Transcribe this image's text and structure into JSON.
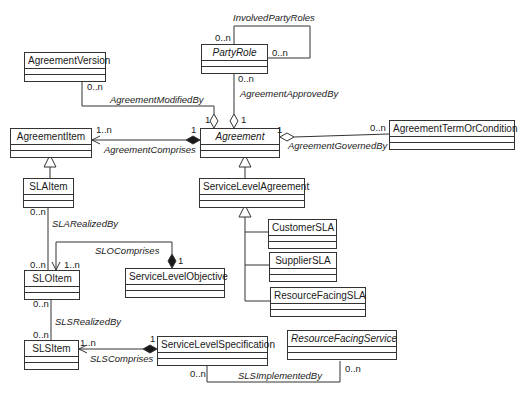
{
  "diagram": {
    "type": "UML class diagram",
    "classes": [
      {
        "id": "agreement_version",
        "name": "AgreementVersion",
        "abstract": false
      },
      {
        "id": "party_role",
        "name": "PartyRole",
        "abstract": true
      },
      {
        "id": "agreement_item",
        "name": "AgreementItem",
        "abstract": false
      },
      {
        "id": "agreement",
        "name": "Agreement",
        "abstract": true
      },
      {
        "id": "agreement_term",
        "name": "AgreementTermOrCondition",
        "abstract": false
      },
      {
        "id": "sla_item",
        "name": "SLAItem",
        "abstract": false
      },
      {
        "id": "service_level_agreement",
        "name": "ServiceLevelAgreement",
        "abstract": false
      },
      {
        "id": "customer_sla",
        "name": "CustomerSLA",
        "abstract": false
      },
      {
        "id": "supplier_sla",
        "name": "SupplierSLA",
        "abstract": false
      },
      {
        "id": "resource_facing_sla",
        "name": "ResourceFacingSLA",
        "abstract": false
      },
      {
        "id": "slo_item",
        "name": "SLOItem",
        "abstract": false
      },
      {
        "id": "service_level_objective",
        "name": "ServiceLevelObjective",
        "abstract": false
      },
      {
        "id": "sls_item",
        "name": "SLSItem",
        "abstract": false
      },
      {
        "id": "service_level_specification",
        "name": "ServiceLevelSpecification",
        "abstract": false
      },
      {
        "id": "resource_facing_service",
        "name": "ResourceFacingService",
        "abstract": true
      }
    ],
    "associations": {
      "involved_party_roles": {
        "label": "InvolvedPartyRoles",
        "m1": "0..n",
        "m2": "0..n"
      },
      "agreement_modified_by": {
        "label": "AgreementModifiedBy",
        "m_source": "0..n",
        "m_target": "1"
      },
      "agreement_approved_by": {
        "label": "AgreementApprovedBy",
        "m_source": "0..n",
        "m_target": "1"
      },
      "agreement_comprises": {
        "label": "AgreementComprises",
        "m_part": "1..n",
        "m_whole": "1"
      },
      "agreement_governed_by": {
        "label": "AgreementGovernedBy",
        "m_whole": "1",
        "m_part": "0..n"
      },
      "sla_realized_by": {
        "label": "SLARealizedBy",
        "m_top": "0..n",
        "m_bottom": "0..n"
      },
      "slo_comprises": {
        "label": "SLOComprises",
        "m_part": "1..n",
        "m_whole": "1"
      },
      "sls_realized_by": {
        "label": "SLSRealizedBy",
        "m_top": "0..n",
        "m_bottom": "0..n"
      },
      "sls_comprises": {
        "label": "SLSComprises",
        "m_part": "1..n",
        "m_whole": "1"
      },
      "sls_implemented_by": {
        "label": "SLSImplementedBy",
        "m_left": "0..n",
        "m_right": "0..n"
      }
    },
    "generalizations": [
      {
        "child": "SLAItem",
        "parent": "AgreementItem"
      },
      {
        "child": "ServiceLevelAgreement",
        "parent": "Agreement"
      },
      {
        "child": "CustomerSLA",
        "parent": "ServiceLevelAgreement"
      },
      {
        "child": "SupplierSLA",
        "parent": "ServiceLevelAgreement"
      },
      {
        "child": "ResourceFacingSLA",
        "parent": "ServiceLevelAgreement"
      }
    ]
  }
}
